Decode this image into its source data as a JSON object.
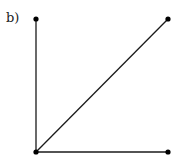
{
  "figure": {
    "label": "b)",
    "line_color": "#1a1a1a",
    "point_color": "#000000",
    "points": [
      {
        "name": "top-left",
        "x": 36,
        "y": 19
      },
      {
        "name": "top-right",
        "x": 168,
        "y": 19
      },
      {
        "name": "bottom-left",
        "x": 36,
        "y": 152
      },
      {
        "name": "bottom-right",
        "x": 168,
        "y": 152
      }
    ],
    "edges": [
      {
        "from": "bottom-left",
        "to": "top-left"
      },
      {
        "from": "bottom-left",
        "to": "top-right"
      },
      {
        "from": "bottom-left",
        "to": "bottom-right"
      }
    ]
  }
}
